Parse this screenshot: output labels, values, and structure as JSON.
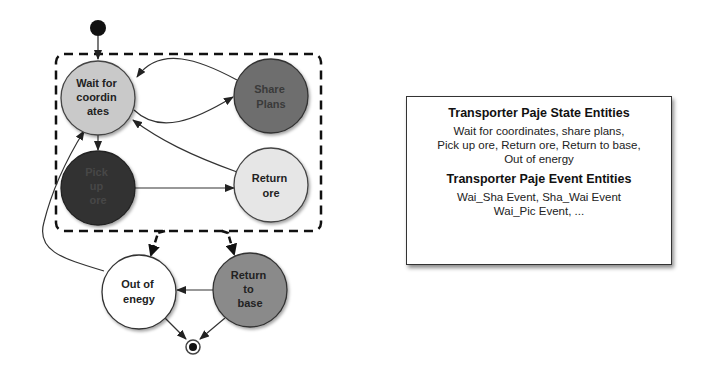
{
  "diagram": {
    "type": "state-machine",
    "initial_node": {
      "x": 98,
      "y": 28
    },
    "final_node": {
      "x": 193,
      "y": 347
    },
    "composite_region": {
      "style": "dashed"
    },
    "states": [
      {
        "id": "wait",
        "lines": [
          "Wait for",
          "coordin",
          "ates"
        ],
        "fill": "#c9c9c9",
        "text_color": "#222222"
      },
      {
        "id": "share",
        "lines": [
          "Share",
          "Plans"
        ],
        "fill": "#6e6e6e",
        "text_color": "#3a3a3a"
      },
      {
        "id": "pick",
        "lines": [
          "Pick",
          "up",
          "ore"
        ],
        "fill": "#333333",
        "text_color": "#444444"
      },
      {
        "id": "return_ore",
        "lines": [
          "Return",
          "ore"
        ],
        "fill": "#e6e6e6",
        "text_color": "#222222"
      },
      {
        "id": "out_energy",
        "lines": [
          "Out of",
          "enegy"
        ],
        "fill": "#ffffff",
        "text_color": "#222222"
      },
      {
        "id": "return_base",
        "lines": [
          "Return",
          "to",
          "base"
        ],
        "fill": "#8a8a8a",
        "text_color": "#222222"
      }
    ],
    "transitions": [
      {
        "from": "initial",
        "to": "wait"
      },
      {
        "from": "wait",
        "to": "share"
      },
      {
        "from": "share",
        "to": "wait"
      },
      {
        "from": "wait",
        "to": "pick"
      },
      {
        "from": "pick",
        "to": "return_ore"
      },
      {
        "from": "return_ore",
        "to": "wait"
      },
      {
        "from": "composite",
        "to": "out_energy"
      },
      {
        "from": "composite",
        "to": "return_base"
      },
      {
        "from": "return_base",
        "to": "out_energy"
      },
      {
        "from": "out_energy",
        "to": "wait"
      },
      {
        "from": "out_energy",
        "to": "final"
      },
      {
        "from": "return_base",
        "to": "final"
      }
    ]
  },
  "legend": {
    "state_title": "Transporter Paje State Entities",
    "state_lines": [
      "Wait for coordinates, share plans,",
      "Pick up ore, Return ore, Return to base,",
      "Out of energy"
    ],
    "event_title": "Transporter Paje Event Entities",
    "event_lines": [
      "Wai_Sha Event, Sha_Wai Event",
      "Wai_Pic Event, ..."
    ]
  }
}
